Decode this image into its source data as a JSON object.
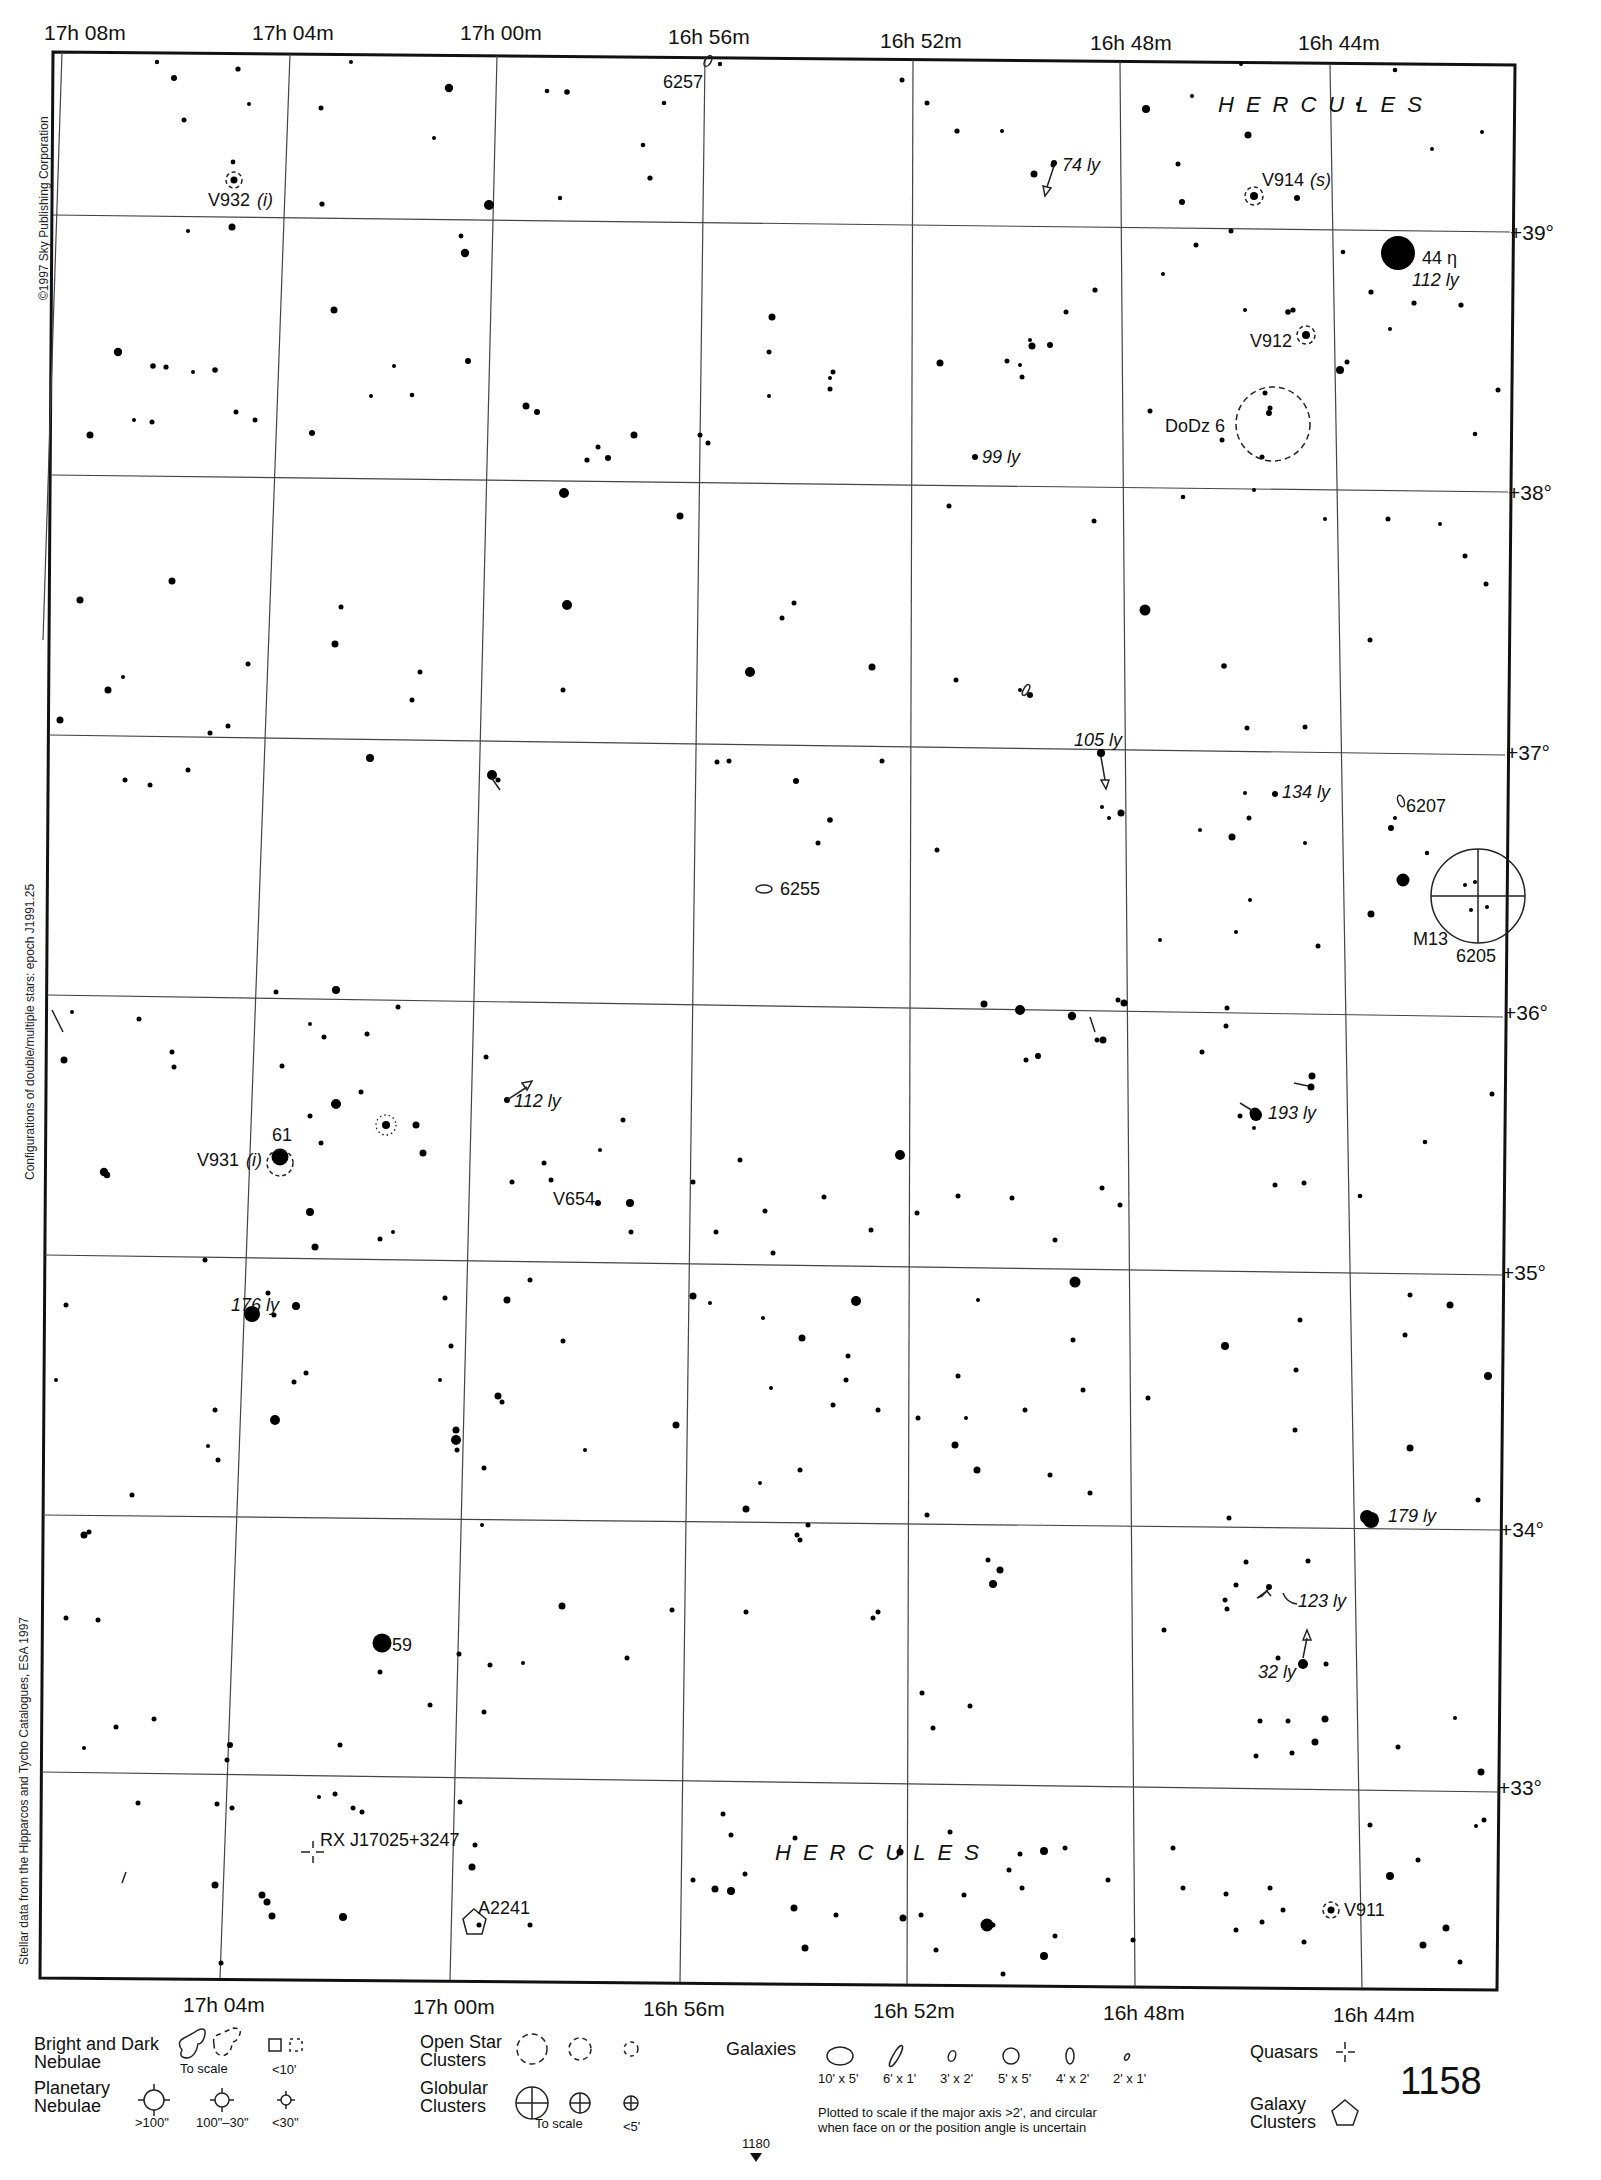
{
  "chart": {
    "page_number": "1158",
    "page_top_partial": "1133",
    "next_page_ref": "1180",
    "copyright": "©1997 Sky Publishing Corporation",
    "side_note_epoch": "Configurations of double/multiple stars: epoch J1991.25",
    "side_note_data": "Stellar data from the Hipparcos and Tycho Catalogues, ESA 1997",
    "constellation_top": "HERCULES",
    "constellation_bottom": "HERCULES"
  },
  "axes": {
    "ra_top": [
      "17h 08m",
      "17h 04m",
      "17h 00m",
      "16h 56m",
      "16h 52m",
      "16h 48m",
      "16h 44m"
    ],
    "ra_bottom": [
      "17h 04m",
      "17h 00m",
      "16h 56m",
      "16h 52m",
      "16h 48m",
      "16h 44m"
    ],
    "dec": [
      "+39°",
      "+38°",
      "+37°",
      "+36°",
      "+35°",
      "+34°",
      "+33°"
    ]
  },
  "labels": {
    "ngc6257": "6257",
    "v932": "V932",
    "v932_note": "(i)",
    "d74": "74 ly",
    "v914": "V914",
    "v914_note": "(s)",
    "eta": "44 η",
    "eta_dist": "112 ly",
    "v912": "V912",
    "dodz6": "DoDz 6",
    "d99": "99 ly",
    "d105": "105 ly",
    "d134": "134 ly",
    "ngc6207": "6207",
    "ngc6255": "6255",
    "m13": "M13",
    "ngc6205": "6205",
    "d112b": "112 ly",
    "d193": "193 ly",
    "s61": "61",
    "v931": "V931",
    "v931_note": "(i)",
    "v654": "V654",
    "d176": "176 ly",
    "d179": "179 ly",
    "d123": "123 ly",
    "d32": "32 ly",
    "s59": "59",
    "rxj": "RX J17025+3247",
    "a2241": "A2241",
    "v911": "V911"
  },
  "legend": {
    "nebulae_title_1": "Bright and Dark",
    "nebulae_title_2": "Nebulae",
    "nebulae_to_scale": "To scale",
    "nebulae_small": "<10'",
    "planetary_title_1": "Planetary",
    "planetary_title_2": "Nebulae",
    "planetary_sizes": [
      ">100\"",
      "100\"–30\"",
      "<30\""
    ],
    "open_title_1": "Open Star",
    "open_title_2": "Clusters",
    "globular_title_1": "Globular",
    "globular_title_2": "Clusters",
    "globular_to_scale": "To scale",
    "globular_small": "<5'",
    "galaxies_title": "Galaxies",
    "galaxy_sizes": [
      "10' x 5'",
      "6' x 1'",
      "3' x 2'",
      "5' x 5'",
      "4' x 2'",
      "2' x 1'"
    ],
    "galaxy_note_1": "Plotted to scale if the major axis >2', and circular",
    "galaxy_note_2": "when face on or the position angle is uncertain",
    "quasars_title": "Quasars",
    "galaxy_clusters_title_1": "Galaxy",
    "galaxy_clusters_title_2": "Clusters"
  },
  "colors": {
    "ink": "#111111",
    "paper": "#ffffff",
    "grid": "#444444"
  }
}
